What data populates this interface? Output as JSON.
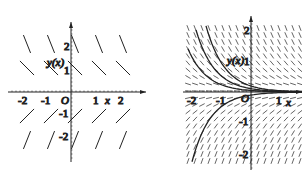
{
  "figures": [
    {
      "id": "left",
      "kind": "direction-field-sparse",
      "origin_px": [
        71,
        92
      ],
      "unit_px": 24,
      "x_ticks": [
        "-2",
        "-1",
        "1",
        "2"
      ],
      "y_ticks": [
        "2",
        "1",
        "-1",
        "-2"
      ],
      "origin_label": "O",
      "x_axis_label": "x",
      "y_axis_label": "y(x)",
      "slope_rule": "y' = -y (segments descend above x-axis, ascend below)"
    },
    {
      "id": "right",
      "kind": "direction-field-dense-with-solutions",
      "origin_px": [
        251,
        92
      ],
      "unit_px": 30,
      "x_ticks": [
        "-2",
        "-1",
        "1"
      ],
      "y_ticks": [
        "2",
        "1",
        "-1",
        "-2"
      ],
      "origin_label": "O",
      "x_axis_label": "x",
      "y_axis_label": "y(x)",
      "solution_curves_desc": "three curves decaying from upper-left toward y=0, one curve rising from lower-left toward y=0"
    }
  ],
  "colors": {
    "ink": "#222222",
    "background": "#ffffff"
  }
}
